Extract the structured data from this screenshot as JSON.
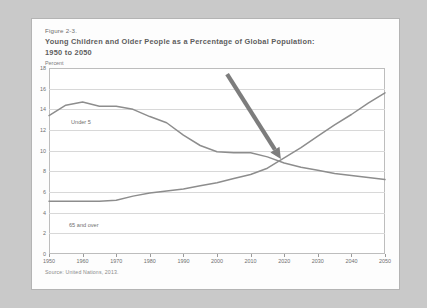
{
  "figure": {
    "number": "Figure 2-3.",
    "title": "Young Children and Older People as a Percentage of Global Population:",
    "subtitle": "1950 to 2050",
    "axis_unit": "Percent",
    "source": "Source: United Nations, 2013."
  },
  "colors": {
    "page_background": "#c9c9c9",
    "card_background": "#fdfdfd",
    "plot_background": "#ffffff",
    "gridline": "#d8d8d8",
    "frame": "#bdbdbd",
    "series_line": "#8d8d8d",
    "arrow": "#7d7d7d",
    "title_text": "#5d5d5d",
    "tick_text": "#6f6f6f"
  },
  "chart_data": {
    "type": "line",
    "title": "Young Children and Older People as a Percentage of Global Population: 1950 to 2050",
    "xlabel": "",
    "ylabel": "Percent",
    "xlim": [
      1950,
      2050
    ],
    "ylim": [
      0,
      18
    ],
    "ytick_labels": [
      "0",
      "2",
      "4",
      "6",
      "8",
      "10",
      "12",
      "14",
      "16",
      "18"
    ],
    "yticks": [
      0,
      2,
      4,
      6,
      8,
      10,
      12,
      14,
      16,
      18
    ],
    "xtick_labels": [
      "1950",
      "1960",
      "1970",
      "1980",
      "1990",
      "2000",
      "2010",
      "2020",
      "2030",
      "2040",
      "2050"
    ],
    "xticks": [
      1950,
      1960,
      1970,
      1980,
      1990,
      2000,
      2010,
      2020,
      2030,
      2040,
      2050
    ],
    "grid": true,
    "legend": "inline-labels",
    "x": [
      1950,
      1955,
      1960,
      1965,
      1970,
      1975,
      1980,
      1985,
      1990,
      1995,
      2000,
      2005,
      2010,
      2015,
      2020,
      2025,
      2030,
      2035,
      2040,
      2045,
      2050
    ],
    "series": [
      {
        "name": "Under 5",
        "label": "Under 5",
        "values": [
          13.4,
          14.4,
          14.7,
          14.3,
          14.3,
          14.0,
          13.3,
          12.7,
          11.5,
          10.5,
          9.9,
          9.8,
          9.8,
          9.4,
          8.8,
          8.4,
          8.1,
          7.8,
          7.6,
          7.4,
          7.2
        ]
      },
      {
        "name": "65 and over",
        "label": "65 and over",
        "values": [
          5.1,
          5.1,
          5.1,
          5.1,
          5.2,
          5.6,
          5.9,
          6.1,
          6.3,
          6.6,
          6.9,
          7.3,
          7.7,
          8.3,
          9.3,
          10.3,
          11.4,
          12.5,
          13.5,
          14.6,
          15.6
        ]
      }
    ],
    "annotations": [
      {
        "type": "arrow",
        "name": "crossover-arrow",
        "from": [
          2003,
          17.4
        ],
        "to": [
          2019,
          9.2
        ],
        "description": "Arrow pointing to the crossover of the two series"
      }
    ]
  }
}
